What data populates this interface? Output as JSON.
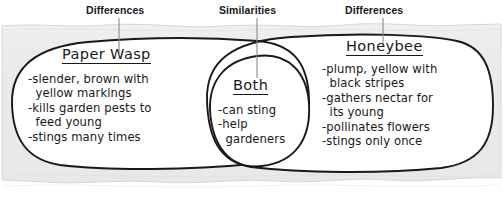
{
  "diagram": {
    "type": "venn-diagram",
    "callouts": {
      "left": "Differences",
      "middle": "Similarities",
      "right": "Differences"
    },
    "left_circle": {
      "heading": "Paper Wasp",
      "items": [
        "-slender, brown with",
        "  yellow markings",
        "-kills garden pests to",
        "  feed young",
        "-stings many times"
      ]
    },
    "center_circle": {
      "heading": "Both",
      "items": [
        "-can sting",
        "-help",
        "  gardeners"
      ]
    },
    "right_circle": {
      "heading": "Honeybee",
      "items": [
        "-plump, yellow with",
        "  black stripes",
        "-gathers nectar for",
        "  its young",
        "-pollinates flowers",
        "-stings only once"
      ]
    },
    "colors": {
      "ink": "#17191b",
      "paper": "#ebebeb",
      "circle_fill": "#ffffff",
      "page_background": "#ffffff",
      "callout_text": "#16181a",
      "leader_line": "#8a8a8a"
    }
  }
}
